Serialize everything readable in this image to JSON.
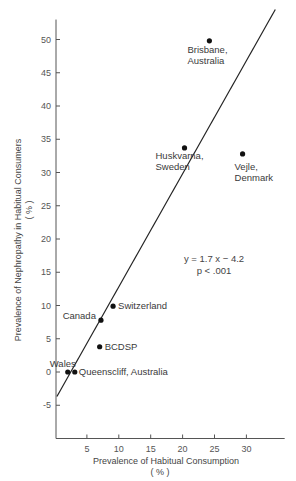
{
  "chart_data": {
    "type": "scatter",
    "title": "",
    "xlabel": "Prevalence of Habitual Consumption",
    "xlabel_unit": "( % )",
    "ylabel": "Prevalence of Nephropathy in Habitual Consumers",
    "ylabel_unit": "( % )",
    "xlim": [
      0,
      36
    ],
    "ylim": [
      -10,
      53
    ],
    "xticks": [
      5,
      10,
      15,
      20,
      25,
      30
    ],
    "yticks": [
      -5,
      0,
      5,
      10,
      15,
      20,
      25,
      30,
      35,
      40,
      45,
      50
    ],
    "grid": false,
    "legend": null,
    "points": [
      {
        "label": "Brisbane, Australia",
        "x": 24.2,
        "y": 49.8
      },
      {
        "label": "Huskvarna, Sweden",
        "x": 20.3,
        "y": 33.7
      },
      {
        "label": "Vejle, Denmark",
        "x": 29.4,
        "y": 32.8
      },
      {
        "label": "Switzerland",
        "x": 9.1,
        "y": 9.9
      },
      {
        "label": "Canada",
        "x": 7.2,
        "y": 7.8
      },
      {
        "label": "BCDSP",
        "x": 7.0,
        "y": 3.8
      },
      {
        "label": "Wales",
        "x": 2.0,
        "y": 0.0
      },
      {
        "label": "Queenscliff, Australia",
        "x": 3.1,
        "y": 0.0
      }
    ],
    "regression": {
      "slope": 1.7,
      "intercept": -4.2,
      "x_range": [
        0.3,
        35
      ],
      "equation_text": "y = 1.7 x  −  4.2",
      "p_text": "p < .001"
    }
  }
}
